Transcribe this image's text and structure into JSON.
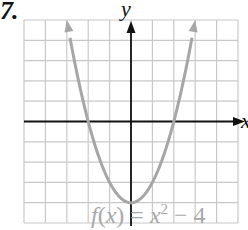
{
  "problem_number": "7.",
  "chart_data": {
    "type": "line",
    "title": "",
    "function_label": "f(x) = x^2 - 4",
    "function_label_parts": {
      "f": "f",
      "open": "(",
      "var": "x",
      "close": ")",
      "eq": " = ",
      "base": "x",
      "exp": "2",
      "rest": " − 4"
    },
    "xlabel": "x",
    "ylabel": "y",
    "xlim": [
      -5,
      5
    ],
    "ylim": [
      -5,
      5
    ],
    "grid": true,
    "grid_step": 1,
    "axis_arrows": true,
    "series": [
      {
        "name": "f(x) = x^2 - 4",
        "x": [
          -3,
          -2.5,
          -2,
          -1.5,
          -1,
          -0.5,
          0,
          0.5,
          1,
          1.5,
          2,
          2.5,
          3
        ],
        "y": [
          5,
          2.25,
          0,
          -1.75,
          -3,
          -3.75,
          -4,
          -3.75,
          -3,
          -1.75,
          0,
          2.25,
          5
        ],
        "arrows_at_ends": true
      }
    ],
    "key_points": {
      "vertex": [
        0,
        -4
      ],
      "x_intercepts": [
        [
          -2,
          0
        ],
        [
          2,
          0
        ]
      ],
      "y_intercept": [
        0,
        -4
      ]
    },
    "colors": {
      "grid": "#c8c8c8",
      "axis": "#111111",
      "curve": "#a6a6a6",
      "label": "#a8a8a8"
    }
  }
}
